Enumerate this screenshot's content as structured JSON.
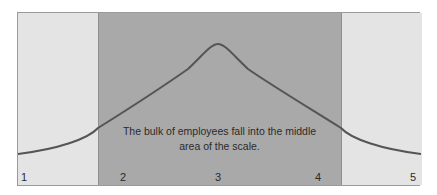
{
  "diagram": {
    "type": "bell-curve",
    "scale_labels": [
      "1",
      "2",
      "3",
      "4",
      "5"
    ],
    "annotation_lines": [
      "The bulk of employees fall into the middle",
      "area of the scale."
    ],
    "colors": {
      "outer_band": "#e4e4e4",
      "middle_band": "#a9a9a9",
      "curve": "#555555",
      "border": "#9a9a9a"
    },
    "highlighted_range": [
      "2",
      "4"
    ]
  }
}
